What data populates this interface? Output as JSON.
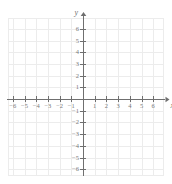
{
  "figure": {
    "kind": "cartesian-coordinate-plane",
    "width": 172,
    "height": 184,
    "background_color": "#ffffff"
  },
  "axes": {
    "x": {
      "label": "x",
      "min": -6,
      "max": 6,
      "tick_labels": [
        "−6",
        "−5",
        "−4",
        "−3",
        "−2",
        "−1",
        "1",
        "2",
        "3",
        "4",
        "5",
        "6"
      ],
      "tick_values": [
        -6,
        -5,
        -4,
        -3,
        -2,
        -1,
        1,
        2,
        3,
        4,
        5,
        6
      ],
      "color": "#6f6f6f"
    },
    "y": {
      "label": "y",
      "min": -6,
      "max": 6,
      "tick_labels": [
        "6",
        "5",
        "4",
        "3",
        "2",
        "1",
        "−1",
        "−2",
        "−3",
        "−4",
        "−5",
        "−6"
      ],
      "tick_values": [
        6,
        5,
        4,
        3,
        2,
        1,
        -1,
        -2,
        -3,
        -4,
        -5,
        -6
      ],
      "color": "#6f6f6f"
    }
  },
  "grid": {
    "visible": true,
    "color": "#ececec",
    "spacing_units": 1
  },
  "origin": {
    "label": "",
    "x_px": 83,
    "y_px": 99
  },
  "style": {
    "tick_label_color": "#7a7a7a",
    "axis_label_color": "#6f6f6f",
    "arrowheads": true
  },
  "chart_data": {
    "type": "scatter",
    "title": "",
    "xlabel": "x",
    "ylabel": "y",
    "xlim": [
      -6,
      6
    ],
    "ylim": [
      -6,
      6
    ],
    "grid": true,
    "legend": null,
    "x": [],
    "y": [],
    "series": [],
    "annotations": []
  }
}
